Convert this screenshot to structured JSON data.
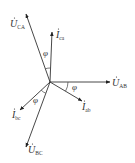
{
  "diagram": {
    "type": "phasor-diagram",
    "origin": [
      50,
      82
    ],
    "vectors": [
      {
        "id": "U_CA",
        "main": "U",
        "sub": "CA",
        "dot": true,
        "tip": [
          26,
          14
        ],
        "label_pos": [
          10,
          27
        ]
      },
      {
        "id": "I_ca",
        "main": "I",
        "sub": "ca",
        "dot": true,
        "tip": [
          52,
          32
        ],
        "label_pos": [
          56,
          38
        ]
      },
      {
        "id": "U_AB",
        "main": "U",
        "sub": "AB",
        "dot": true,
        "tip": [
          110,
          82
        ],
        "label_pos": [
          112,
          86
        ]
      },
      {
        "id": "I_ab",
        "main": "I",
        "sub": "ab",
        "dot": true,
        "tip": [
          82,
          101
        ],
        "label_pos": [
          82,
          110
        ]
      },
      {
        "id": "I_bc",
        "main": "I",
        "sub": "bc",
        "dot": true,
        "tip": [
          20,
          110
        ],
        "label_pos": [
          12,
          118
        ]
      },
      {
        "id": "U_BC",
        "main": "U",
        "sub": "BC",
        "dot": true,
        "tip": [
          26,
          147
        ],
        "label_pos": [
          28,
          153
        ]
      }
    ],
    "angles": [
      {
        "symbol": "φ",
        "between": [
          "U_CA",
          "I_ca"
        ],
        "label_pos": [
          43,
          56
        ]
      },
      {
        "symbol": "φ",
        "between": [
          "U_AB",
          "I_ab"
        ],
        "label_pos": [
          72,
          90
        ]
      },
      {
        "symbol": "φ",
        "between": [
          "I_bc",
          "U_BC"
        ],
        "label_pos": [
          33,
          103
        ]
      }
    ]
  }
}
